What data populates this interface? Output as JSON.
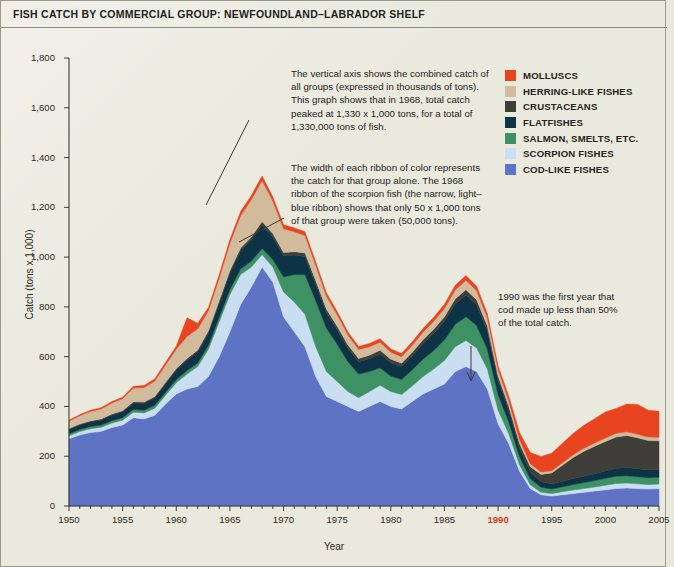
{
  "page_title": "FISH CATCH BY COMMERCIAL GROUP: NEWFOUNDLAND–LABRADOR SHELF",
  "legend": {
    "items": [
      {
        "label": "MOLLUSCS",
        "color": "#e8441f"
      },
      {
        "label": "HERRING-LIKE FISHES",
        "color": "#d2bb9c"
      },
      {
        "label": "CRUSTACEANS",
        "color": "#403e39"
      },
      {
        "label": "FLATFISHES",
        "color": "#0d3347"
      },
      {
        "label": "SALMON, SMELTS, ETC.",
        "color": "#3d9163"
      },
      {
        "label": "SCORPION FISHES",
        "color": "#cadef2"
      },
      {
        "label": "COD-LIKE FISHES",
        "color": "#5f73c4"
      }
    ]
  },
  "annotations": {
    "a1": "The vertical axis shows the combined catch of all groups (expressed in thousands of tons). This graph shows that in 1968, total catch peaked at 1,330 x 1,000 tons, for a total of 1,330,000 tons of fish.",
    "a2": "The width of each ribbon of color represents the catch for that group alone. The 1968 ribbon of the scorpion fish (the narrow, light–blue ribbon) shows that only 50 x 1,000 tons of that group were taken (50,000 tons).",
    "a3": "1990 was the first year that cod made up less than 50% of the total catch."
  },
  "axes": {
    "y_label": "Catch (tons x 1,000)",
    "x_label": "Year",
    "y_ticks": [
      "0",
      "200",
      "400",
      "600",
      "800",
      "1,000",
      "1,200",
      "1,400",
      "1,600",
      "1,800"
    ],
    "x_ticks": [
      "1950",
      "1955",
      "1960",
      "1965",
      "1970",
      "1975",
      "1980",
      "1985",
      "1990",
      "1995",
      "2000",
      "2005"
    ],
    "highlight_x_tick": "1990"
  },
  "chart_data": {
    "type": "area",
    "title": "FISH CATCH BY COMMERCIAL GROUP: NEWFOUNDLAND–LABRADOR SHELF",
    "xlabel": "Year",
    "ylabel": "Catch (tons x 1,000)",
    "ylim": [
      0,
      1800
    ],
    "xlim": [
      1950,
      2005
    ],
    "grid": false,
    "legend_position": "top-right",
    "stacked": true,
    "stack_order_bottom_to_top": [
      "COD-LIKE FISHES",
      "SCORPION FISHES",
      "SALMON, SMELTS, ETC.",
      "FLATFISHES",
      "CRUSTACEANS",
      "HERRING-LIKE FISHES",
      "MOLLUSCS"
    ],
    "x": [
      1950,
      1951,
      1952,
      1953,
      1954,
      1955,
      1956,
      1957,
      1958,
      1959,
      1960,
      1961,
      1962,
      1963,
      1964,
      1965,
      1966,
      1967,
      1968,
      1969,
      1970,
      1971,
      1972,
      1973,
      1974,
      1975,
      1976,
      1977,
      1978,
      1979,
      1980,
      1981,
      1982,
      1983,
      1984,
      1985,
      1986,
      1987,
      1988,
      1989,
      1990,
      1991,
      1992,
      1993,
      1994,
      1995,
      1996,
      1997,
      1998,
      1999,
      2000,
      2001,
      2002,
      2003,
      2004,
      2005
    ],
    "series": [
      {
        "name": "COD-LIKE FISHES",
        "color": "#5f73c4",
        "values": [
          270,
          285,
          295,
          300,
          315,
          325,
          355,
          350,
          365,
          410,
          450,
          470,
          480,
          520,
          600,
          700,
          810,
          880,
          960,
          900,
          760,
          700,
          640,
          520,
          440,
          420,
          400,
          380,
          400,
          420,
          400,
          390,
          420,
          450,
          470,
          490,
          540,
          560,
          540,
          470,
          330,
          250,
          140,
          70,
          45,
          40,
          45,
          50,
          55,
          60,
          65,
          70,
          72,
          70,
          68,
          70
        ]
      },
      {
        "name": "SCORPION FISHES",
        "color": "#cadef2",
        "values": [
          12,
          14,
          15,
          16,
          18,
          20,
          22,
          24,
          28,
          35,
          45,
          60,
          80,
          110,
          140,
          150,
          120,
          80,
          50,
          60,
          100,
          120,
          130,
          120,
          100,
          80,
          60,
          55,
          60,
          65,
          60,
          58,
          62,
          70,
          80,
          95,
          100,
          105,
          95,
          80,
          55,
          40,
          25,
          15,
          10,
          10,
          12,
          14,
          15,
          16,
          18,
          20,
          20,
          19,
          18,
          18
        ]
      },
      {
        "name": "SALMON, SMELTS, ETC.",
        "color": "#3d9163",
        "values": [
          8,
          8,
          9,
          9,
          10,
          10,
          11,
          11,
          12,
          12,
          13,
          14,
          15,
          16,
          18,
          20,
          22,
          24,
          25,
          30,
          60,
          110,
          160,
          185,
          175,
          150,
          120,
          95,
          80,
          70,
          62,
          60,
          65,
          70,
          75,
          82,
          90,
          95,
          90,
          80,
          62,
          48,
          34,
          25,
          20,
          18,
          20,
          22,
          24,
          26,
          28,
          30,
          30,
          29,
          28,
          28
        ]
      },
      {
        "name": "FLATFISHES",
        "color": "#0d3347",
        "values": [
          18,
          19,
          20,
          21,
          23,
          24,
          26,
          28,
          30,
          34,
          38,
          42,
          45,
          50,
          58,
          66,
          74,
          85,
          95,
          92,
          85,
          78,
          72,
          66,
          62,
          58,
          54,
          50,
          52,
          56,
          54,
          52,
          56,
          62,
          68,
          75,
          82,
          88,
          84,
          74,
          58,
          46,
          34,
          26,
          22,
          20,
          22,
          24,
          26,
          28,
          30,
          32,
          33,
          32,
          31,
          31
        ]
      },
      {
        "name": "CRUSTACEANS",
        "color": "#403e39",
        "values": [
          3,
          3,
          3,
          4,
          4,
          4,
          5,
          5,
          5,
          6,
          6,
          7,
          7,
          8,
          9,
          10,
          11,
          12,
          13,
          13,
          14,
          14,
          15,
          15,
          14,
          14,
          13,
          13,
          14,
          15,
          14,
          14,
          15,
          16,
          17,
          18,
          20,
          21,
          20,
          19,
          17,
          16,
          18,
          22,
          30,
          45,
          65,
          85,
          100,
          110,
          118,
          125,
          128,
          124,
          118,
          115
        ]
      },
      {
        "name": "HERRING-LIKE FISHES",
        "color": "#d2bb9c",
        "values": [
          30,
          34,
          38,
          40,
          44,
          48,
          55,
          58,
          62,
          70,
          78,
          88,
          85,
          80,
          90,
          110,
          130,
          150,
          165,
          130,
          95,
          80,
          70,
          60,
          52,
          46,
          40,
          36,
          34,
          32,
          28,
          26,
          28,
          30,
          32,
          34,
          36,
          38,
          36,
          32,
          26,
          22,
          16,
          12,
          10,
          9,
          10,
          11,
          12,
          13,
          14,
          15,
          15,
          14,
          14,
          14
        ]
      },
      {
        "name": "MOLLUSCS",
        "color": "#e8441f",
        "values": [
          4,
          4,
          5,
          5,
          6,
          6,
          7,
          8,
          9,
          10,
          12,
          75,
          22,
          14,
          14,
          15,
          16,
          17,
          18,
          17,
          16,
          15,
          15,
          14,
          13,
          13,
          12,
          12,
          13,
          14,
          13,
          13,
          14,
          15,
          16,
          17,
          18,
          19,
          18,
          17,
          15,
          18,
          28,
          45,
          62,
          70,
          78,
          85,
          92,
          98,
          105,
          100,
          112,
          120,
          108,
          105
        ]
      }
    ],
    "annotations": [
      {
        "text": "in 1968, total catch peaked at 1,330 x 1,000 tons",
        "x": 1968,
        "y": 1330
      },
      {
        "text": "1968 scorpion fish ribbon = 50 x 1,000 tons",
        "x": 1968,
        "y": 50
      },
      {
        "text": "1990 was the first year that cod made up less than 50% of the total catch.",
        "x": 1990
      }
    ]
  }
}
